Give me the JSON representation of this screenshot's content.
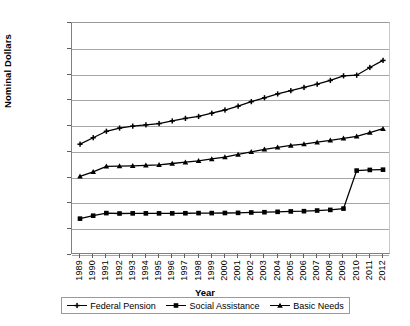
{
  "chart_data": {
    "type": "line",
    "title": "",
    "xlabel": "Year",
    "ylabel": "Nominal Dollars",
    "ylim": [
      0,
      18000
    ],
    "ytick_labels": [
      "18,000",
      "16,000",
      "14,000",
      "12,000",
      "10,000",
      "8,000",
      "6,000",
      "4,000",
      "2,000",
      "0"
    ],
    "ytick_values": [
      18000,
      16000,
      14000,
      12000,
      10000,
      8000,
      6000,
      4000,
      2000,
      0
    ],
    "grid": true,
    "legend_position": "bottom",
    "categories": [
      "1989",
      "1990",
      "1991",
      "1992",
      "1993",
      "1994",
      "1995",
      "1996",
      "1997",
      "1998",
      "1999",
      "2000",
      "2001",
      "2002",
      "2003",
      "2004",
      "2005",
      "2006",
      "2007",
      "2008",
      "2009",
      "2010",
      "2011",
      "2012"
    ],
    "series": [
      {
        "name": "Federal Pension",
        "marker": "cross",
        "values": [
          8600,
          9100,
          9600,
          9850,
          10000,
          10100,
          10200,
          10400,
          10600,
          10750,
          11000,
          11250,
          11550,
          11900,
          12200,
          12500,
          12750,
          13000,
          13250,
          13550,
          13900,
          13950,
          14550,
          15100
        ]
      },
      {
        "name": "Social Assistance",
        "marker": "square",
        "values": [
          2820,
          3050,
          3250,
          3220,
          3230,
          3230,
          3230,
          3230,
          3240,
          3250,
          3250,
          3260,
          3270,
          3300,
          3320,
          3350,
          3380,
          3400,
          3450,
          3500,
          3600,
          6550,
          6600,
          6620
        ]
      },
      {
        "name": "Basic Needs",
        "marker": "triangle",
        "values": [
          6100,
          6450,
          6880,
          6900,
          6920,
          6950,
          7000,
          7100,
          7200,
          7300,
          7450,
          7600,
          7800,
          8000,
          8200,
          8350,
          8500,
          8600,
          8750,
          8900,
          9050,
          9200,
          9500,
          9800
        ]
      }
    ]
  },
  "legend": {
    "items": [
      {
        "label": "Federal Pension",
        "marker": "cross-marker"
      },
      {
        "label": "Social Assistance",
        "marker": "square-marker"
      },
      {
        "label": "Basic Needs",
        "marker": "triangle-marker"
      }
    ]
  }
}
